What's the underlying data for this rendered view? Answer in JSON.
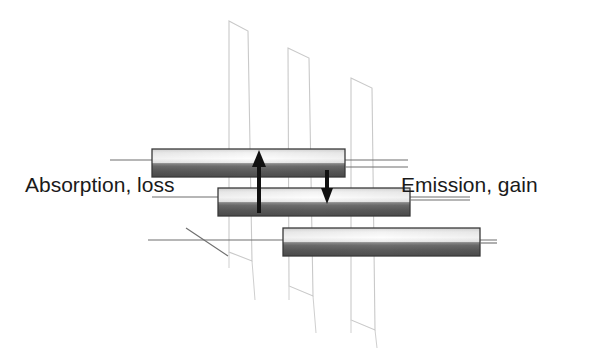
{
  "diagram": {
    "type": "energy-level-transition-diagram",
    "background": "#ffffff",
    "width": 601,
    "height": 353,
    "labels": {
      "absorption": "Absorption, loss",
      "emission": "Emission, gain"
    },
    "colors": {
      "plane_stroke": "#c9c9c9",
      "level_line": "#6e6e6e",
      "bar_border": "#3b3b3b",
      "bar_light": "#fbfbfb",
      "bar_dark": "#4a4a4a",
      "arrow": "#111111",
      "text": "#1a1a1a"
    },
    "planes": [
      {
        "name": "plane-left",
        "points": "229,21 248,31 252,261 229,252"
      },
      {
        "name": "plane-middle",
        "points": "288,48 309,58 313,296 289,286"
      },
      {
        "name": "plane-right",
        "points": "351,78 372,88 375,330 351,320"
      }
    ],
    "level_lines": [
      {
        "name": "level-line-upper",
        "x1": 110,
        "y1": 160,
        "x2": 408,
        "y2": 160
      },
      {
        "name": "level-line-middle",
        "x1": 152,
        "y1": 197,
        "x2": 470,
        "y2": 197
      },
      {
        "name": "level-line-lower",
        "x1": 148,
        "y1": 240,
        "x2": 497,
        "y2": 240
      },
      {
        "name": "level-line-diagonal",
        "x1": 186,
        "y1": 228,
        "x2": 226,
        "y2": 254
      }
    ],
    "bars": [
      {
        "name": "energy-bar-upper",
        "x": 152,
        "y": 149,
        "width": 193,
        "height": 28
      },
      {
        "name": "energy-bar-middle",
        "x": 218,
        "y": 188,
        "width": 192,
        "height": 28
      },
      {
        "name": "energy-bar-lower",
        "x": 283,
        "y": 228,
        "width": 197,
        "height": 28
      }
    ],
    "arrows": [
      {
        "name": "absorption-arrow-up",
        "direction": "up",
        "x": 259,
        "y_tail": 212,
        "y_head": 151,
        "shaft_width": 4,
        "head_width": 12,
        "head_length": 16
      },
      {
        "name": "emission-arrow-down",
        "direction": "down",
        "x": 327,
        "y_tail": 170,
        "y_head": 202,
        "shaft_width": 4,
        "head_width": 11,
        "head_length": 14
      }
    ]
  }
}
